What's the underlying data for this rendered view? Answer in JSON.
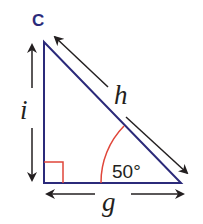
{
  "diagram": {
    "type": "right-triangle",
    "vertex_label": "C",
    "sides": {
      "vertical": "i",
      "hypotenuse": "h",
      "horizontal": "g"
    },
    "angle": {
      "value": "50°",
      "position": "bottom-right vertex"
    },
    "right_angle": "bottom-left vertex",
    "colors": {
      "triangle": "#2b2a7a",
      "angle_arc": "#e0463a",
      "right_angle_marker": "#e0463a",
      "arrows": "#231f20",
      "text": "#231f20"
    }
  }
}
